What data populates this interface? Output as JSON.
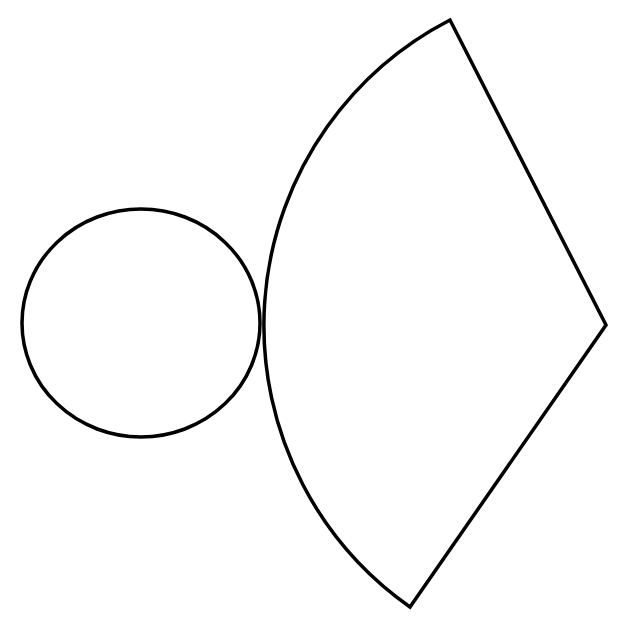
{
  "diagram": {
    "stroke_color": "#000000",
    "background": "#ffffff",
    "circle": {
      "cx": 141,
      "cy": 323,
      "rx": 119,
      "ry": 114
    },
    "sector": {
      "apex": [
        606,
        325
      ],
      "arc_start": [
        450,
        20
      ],
      "arc_end": [
        410,
        607
      ],
      "radius": 344,
      "tangent_point": [
        262,
        323
      ]
    }
  }
}
